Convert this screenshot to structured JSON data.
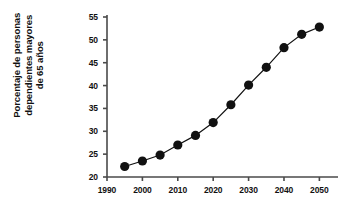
{
  "chart_data": {
    "type": "line",
    "title": "",
    "xlabel": "",
    "ylabel": "Porcentaje de personas dependientes mayores de 65 años",
    "ylabel_lines": [
      "Porcentaje de personas",
      "dependientes mayores",
      "de 65 años"
    ],
    "x": [
      1995,
      2000,
      2005,
      2010,
      2015,
      2020,
      2025,
      2030,
      2035,
      2040,
      2045,
      2050
    ],
    "values": [
      22.3,
      23.5,
      24.8,
      27.0,
      29.1,
      31.9,
      35.8,
      40.1,
      44.0,
      48.3,
      51.2,
      52.8
    ],
    "xlim": [
      1990,
      2053
    ],
    "ylim": [
      20,
      55
    ],
    "xticks": [
      1990,
      2000,
      2010,
      2020,
      2030,
      2040,
      2050
    ],
    "xtick_labels": [
      "1990",
      "2000",
      "2010",
      "2020",
      "2030",
      "2040",
      "2050"
    ],
    "yticks": [
      20,
      25,
      30,
      35,
      40,
      45,
      50,
      55
    ],
    "ytick_labels": [
      "20",
      "25",
      "30",
      "35",
      "40",
      "45",
      "50",
      "55"
    ],
    "grid": false,
    "legend": null,
    "marker": "circle",
    "marker_color": "#111111",
    "line_color": "#111111",
    "axis_color": "#4a4a4a",
    "background_color": "#ffffff"
  }
}
